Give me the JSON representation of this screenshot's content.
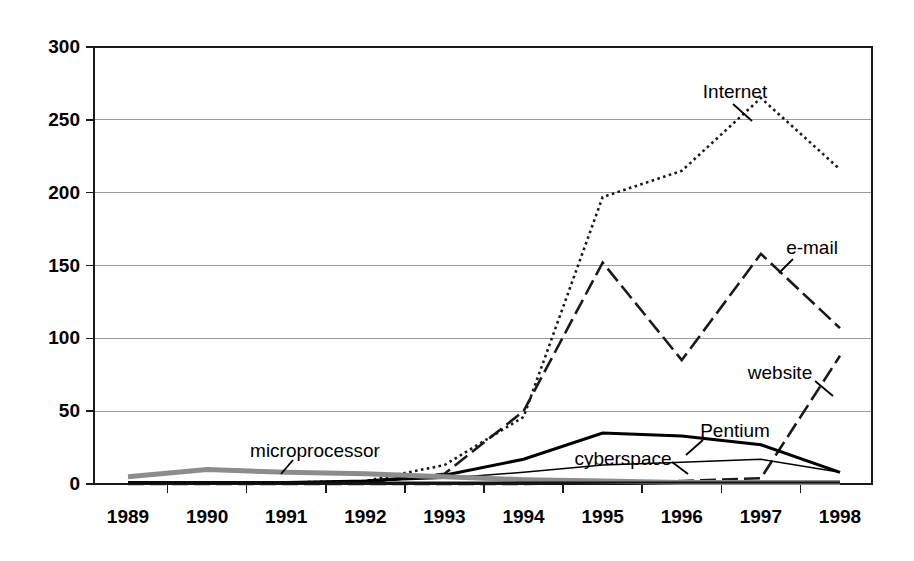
{
  "chart_data": {
    "type": "line",
    "title": "",
    "subtitle": "",
    "xlabel": "",
    "ylabel": "",
    "categories": [
      "1989",
      "1990",
      "1991",
      "1992",
      "1993",
      "1994",
      "1995",
      "1996",
      "1997",
      "1998"
    ],
    "x": [
      1989,
      1990,
      1991,
      1992,
      1993,
      1994,
      1995,
      1996,
      1997,
      1998
    ],
    "xlim": [
      1989,
      1998
    ],
    "ylim": [
      0,
      300
    ],
    "yticks": [
      0,
      50,
      100,
      150,
      200,
      250,
      300
    ],
    "ytick_labels": [
      "0",
      "50",
      "100",
      "150",
      "200",
      "250",
      "300"
    ],
    "grid": true,
    "grid_axis": "y",
    "legend": "inline-annotations",
    "legend_position": "inline",
    "series": [
      {
        "name": "Internet",
        "label": "Internet",
        "style": "dotted",
        "color": "#1a1a1a",
        "width": 2.6,
        "values": [
          1,
          1,
          1,
          2,
          13,
          46,
          197,
          215,
          265,
          216
        ]
      },
      {
        "name": "e-mail",
        "label": "e-mail",
        "style": "dash-dot",
        "color": "#1a1a1a",
        "width": 2.6,
        "values": [
          1,
          1,
          1,
          1,
          7,
          50,
          152,
          85,
          158,
          107
        ]
      },
      {
        "name": "website",
        "label": "website",
        "style": "dash-dot",
        "color": "#1a1a1a",
        "width": 2.6,
        "values": [
          0,
          0,
          0,
          0,
          0,
          0,
          1,
          2,
          4,
          88
        ]
      },
      {
        "name": "Pentium",
        "label": "Pentium",
        "style": "solid-thick",
        "color": "#000000",
        "width": 3.1,
        "values": [
          1,
          1,
          1,
          2,
          6,
          17,
          35,
          33,
          27,
          8
        ]
      },
      {
        "name": "cyberspace",
        "label": "cyberspace",
        "style": "solid-thin",
        "color": "#000000",
        "width": 1.5,
        "values": [
          1,
          1,
          1,
          2,
          4,
          8,
          13,
          15,
          17,
          8
        ]
      },
      {
        "name": "microprocessor",
        "label": "microprocessor",
        "style": "solid-gray-thick",
        "color": "#8c8c8c",
        "width": 5.0,
        "values": [
          5,
          10,
          8,
          7,
          5,
          3,
          2,
          1,
          1,
          1
        ]
      },
      {
        "name": "baseline-dark",
        "label": "",
        "style": "solid-baseline",
        "color": "#111111",
        "width": 2.0,
        "values": [
          1,
          1,
          1,
          1,
          1,
          1,
          1,
          1,
          1,
          1
        ]
      }
    ],
    "annotations": [
      {
        "text": "Internet",
        "x": 735,
        "y": 93,
        "anchor": "middle",
        "leader": "M 733 104 L 752 121"
      },
      {
        "text": "e-mail",
        "x": 812,
        "y": 249,
        "anchor": "middle",
        "leader": "M 793 259 L 779 273"
      },
      {
        "text": "website",
        "x": 780,
        "y": 374,
        "anchor": "middle",
        "leader": "M 815 381 L 833 396"
      },
      {
        "text": "Pentium",
        "x": 735,
        "y": 432,
        "anchor": "middle",
        "leader": "M 703 440 L 686 455"
      },
      {
        "text": "cyberspace",
        "x": 623,
        "y": 460,
        "anchor": "middle",
        "leader": "M 672 462 L 688 474"
      },
      {
        "text": "microprocessor",
        "x": 315,
        "y": 452,
        "anchor": "middle",
        "leader": "M 293 460 L 281 474"
      }
    ]
  },
  "plot": {
    "left": 94,
    "right": 872,
    "top": 47,
    "bottom": 484,
    "first_point_x": 128,
    "last_point_x": 840
  }
}
